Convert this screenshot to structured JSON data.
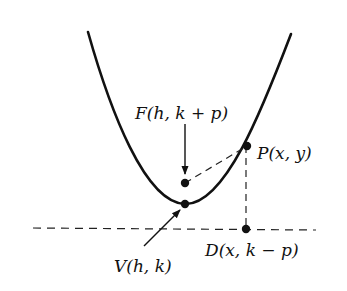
{
  "diagram": {
    "colors": {
      "ink": "#111111",
      "background": "#ffffff"
    },
    "points": {
      "focus": {
        "label": "F(h, k + p)"
      },
      "vertex": {
        "label": "V(h, k)"
      },
      "point": {
        "label": "P(x, y)"
      },
      "directrix_point": {
        "label": "D(x, k − p)"
      }
    },
    "elements": [
      "parabola",
      "directrix (dashed)",
      "segment FP (dashed)",
      "segment PD (dashed)",
      "arrow to F",
      "arrow to V"
    ]
  }
}
